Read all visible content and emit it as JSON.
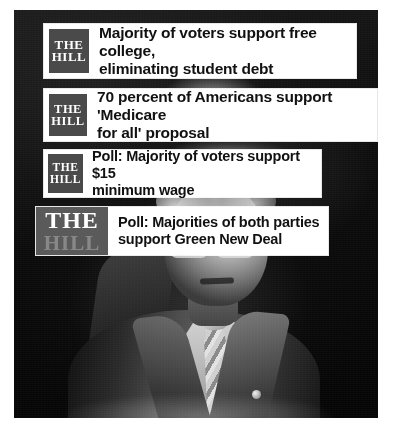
{
  "image": {
    "type": "news-graphic-photo-collage",
    "subject_description": "Black-and-white photograph of an older man in a suit and tie with glasses, one hand raised",
    "background_color": "#0a0a0a",
    "page_background": "#ffffff"
  },
  "brand": {
    "logo_line1": "THE",
    "logo_line2": "HILL",
    "logo_box_color": "#4a4a4a",
    "logo_text_color": "#ffffff"
  },
  "cards": [
    {
      "id": "card1",
      "logo_line1": "THE",
      "logo_line2": "HILL",
      "headline_line1": "Majority of voters support free college,",
      "headline_line2": "eliminating student debt"
    },
    {
      "id": "card2",
      "logo_line1": "THE",
      "logo_line2": "HILL",
      "headline_line1": "70 percent of Americans support 'Medicare",
      "headline_line2": "for all' proposal"
    },
    {
      "id": "card3",
      "logo_line1": "THE",
      "logo_line2": "HILL",
      "headline_line1": "Poll: Majority of voters support $15",
      "headline_line2": "minimum wage"
    },
    {
      "id": "card4",
      "logo_line1": "THE",
      "logo_line2": "HILL",
      "headline_line1": "Poll: Majorities of both parties",
      "headline_line2": "support Green New Deal"
    }
  ]
}
